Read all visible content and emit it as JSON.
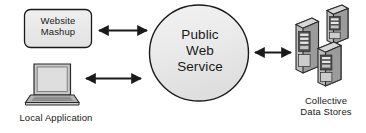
{
  "diagram": {
    "type": "block-diagram",
    "background_color": "#ffffff",
    "stroke_color": "#1a1a1a",
    "fill_light": "#e9e9e9",
    "fill_mid": "#b9b9b9",
    "fill_dark": "#8a8a8a",
    "nodes": [
      {
        "id": "website-mashup",
        "label": "Website\nMashup",
        "shape": "rounded-rectangle",
        "fill": "#e9e9e9"
      },
      {
        "id": "public-web-service",
        "label": "Public\nWeb\nService",
        "shape": "ellipse",
        "fill": "#e9e9e9"
      },
      {
        "id": "local-application",
        "label": "Local Application",
        "shape": "laptop-icon",
        "fill": "#c9c9c9"
      },
      {
        "id": "collective-data-stores",
        "label": "Collective\nData Stores",
        "shape": "server-stack-icon",
        "fill": "#b9b9b9"
      }
    ],
    "connectors": [
      {
        "id": "mashup-to-service",
        "from": "website-mashup",
        "to": "public-web-service",
        "arrow": "double"
      },
      {
        "id": "local-app-to-service",
        "from": "local-application",
        "to": "public-web-service",
        "arrow": "double"
      },
      {
        "id": "service-to-data-stores",
        "from": "public-web-service",
        "to": "collective-data-stores",
        "arrow": "double"
      }
    ]
  }
}
